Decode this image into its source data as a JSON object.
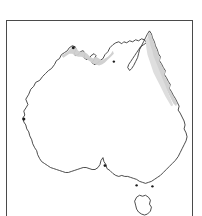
{
  "figure": {
    "type": "map",
    "background_color": "#ffffff",
    "frame": {
      "visible": true,
      "border_color": "#4a4a4a",
      "border_width_px": 1,
      "left_px": 6,
      "top_px": 20,
      "width_px": 187,
      "height_px": 200,
      "cropped_at_bottom": true
    },
    "title": "",
    "caption": "",
    "axis_labels": [],
    "tick_labels": [],
    "legend": {
      "visible": false,
      "entries": []
    },
    "annotations": []
  },
  "map": {
    "outline": {
      "name": "australia-mainland-coastline",
      "fill_color": "#ffffff",
      "stroke_color": "#2b2b2b",
      "stroke_width_px": 0.85
    },
    "islands": [
      {
        "name": "tasmania",
        "fill_color": "#ffffff",
        "stroke_color": "#2b2b2b"
      }
    ],
    "shaded_regions": [
      {
        "name": "north-coast-band",
        "description": "Light grey band along the northern coast from the Kimberley through Arnhem Land to the Gulf of Carpentaria",
        "color": "#cfcfcf"
      },
      {
        "name": "east-queensland-coast-band",
        "description": "Light grey band along the eastern Queensland coast from Cape York south to northern New South Wales",
        "color": "#cfcfcf"
      }
    ],
    "coastal_markers": [
      {
        "name": "west-coast-marker",
        "color": "#1c1c1c"
      },
      {
        "name": "north-coast-marker",
        "color": "#1c1c1c"
      },
      {
        "name": "south-east-marker",
        "color": "#1c1c1c"
      }
    ]
  }
}
